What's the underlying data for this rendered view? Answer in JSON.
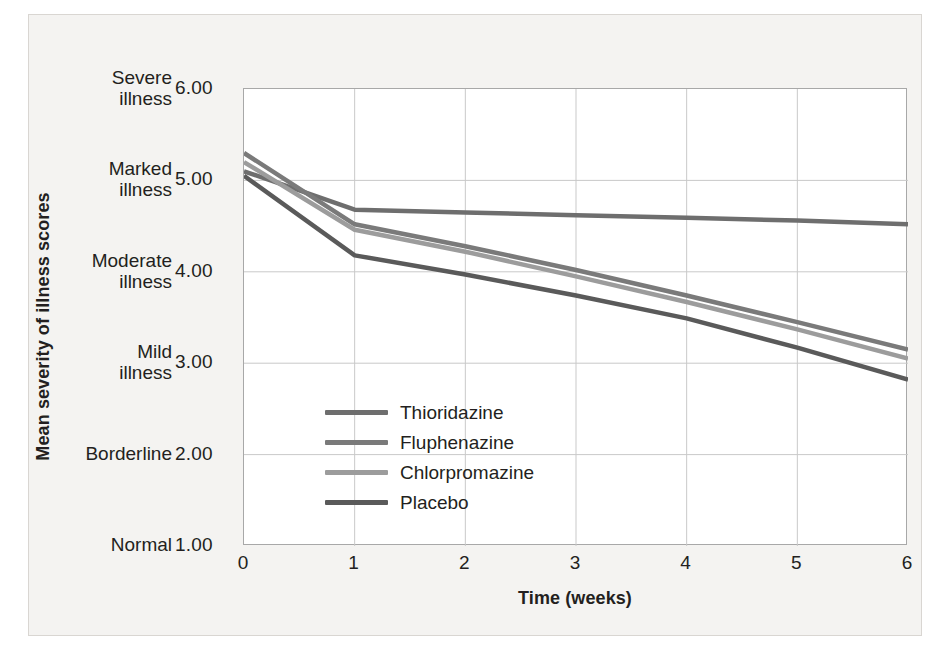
{
  "chart_data": {
    "type": "line",
    "title": "",
    "xlabel": "Time (weeks)",
    "ylabel": "Mean severity of illness scores",
    "x": [
      0,
      1,
      2,
      3,
      4,
      5,
      6
    ],
    "xlim": [
      0,
      6
    ],
    "ylim": [
      1.0,
      6.0
    ],
    "xticks": [
      "0",
      "1",
      "2",
      "3",
      "4",
      "5",
      "6"
    ],
    "yticks": [
      "1.00",
      "2.00",
      "3.00",
      "4.00",
      "5.00",
      "6.00"
    ],
    "ytick_values": [
      1.0,
      2.0,
      3.0,
      4.0,
      5.0,
      6.0
    ],
    "ycategories": [
      {
        "value": 6.0,
        "line1": "Severe",
        "line2": "illness"
      },
      {
        "value": 5.0,
        "line1": "Marked",
        "line2": "illness"
      },
      {
        "value": 4.0,
        "line1": "Moderate",
        "line2": "illness"
      },
      {
        "value": 3.0,
        "line1": "Mild",
        "line2": "illness"
      },
      {
        "value": 2.0,
        "line1": "Borderline",
        "line2": ""
      },
      {
        "value": 1.0,
        "line1": "Normal",
        "line2": ""
      }
    ],
    "grid": "horizontal-and-vertical",
    "legend_position": "inside-lower-left",
    "series": [
      {
        "name": "Thioridazine",
        "color": "#6e6e6e",
        "values": [
          5.1,
          4.68,
          4.65,
          4.62,
          4.59,
          4.56,
          4.52
        ]
      },
      {
        "name": "Fluphenazine",
        "color": "#7a7a7a",
        "values": [
          5.3,
          4.52,
          4.28,
          4.02,
          3.74,
          3.45,
          3.15
        ]
      },
      {
        "name": "Chlorpromazine",
        "color": "#9c9c9c",
        "values": [
          5.2,
          4.46,
          4.22,
          3.95,
          3.67,
          3.37,
          3.05
        ]
      },
      {
        "name": "Placebo",
        "color": "#5a5a5a",
        "values": [
          5.05,
          4.18,
          3.97,
          3.74,
          3.49,
          3.17,
          2.82
        ]
      }
    ]
  },
  "legend": {
    "items": [
      {
        "label": "Thioridazine",
        "color": "#6e6e6e"
      },
      {
        "label": "Fluphenazine",
        "color": "#7a7a7a"
      },
      {
        "label": "Chlorpromazine",
        "color": "#9c9c9c"
      },
      {
        "label": "Placebo",
        "color": "#5a5a5a"
      }
    ]
  },
  "style": {
    "grid_color": "#c9c9c9",
    "axis_color": "#a8a8a8",
    "panel_background": "#f4f3f1",
    "plot_background": "#ffffff",
    "text_color": "#231f20"
  }
}
